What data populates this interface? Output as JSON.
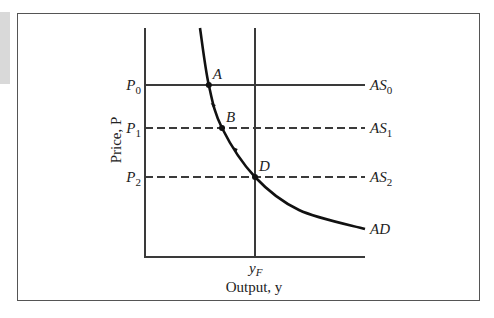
{
  "chart_data": {
    "type": "line",
    "title": "",
    "xlabel": "Output, y",
    "ylabel": "Price, P",
    "grid": false,
    "x_ticks": [
      {
        "label_main": "y",
        "label_sub": "F",
        "value": 0.5
      }
    ],
    "y_ticks": [
      {
        "label_main": "P",
        "label_sub": "0",
        "value": 0.75
      },
      {
        "label_main": "P",
        "label_sub": "1",
        "value": 0.56
      },
      {
        "label_main": "P",
        "label_sub": "2",
        "value": 0.35
      }
    ],
    "xlim": [
      0,
      1
    ],
    "ylim": [
      0,
      1
    ],
    "series": [
      {
        "name": "AS0",
        "label_main": "AS",
        "label_sub": "0",
        "style": "solid",
        "y": 0.75
      },
      {
        "name": "AS1",
        "label_main": "AS",
        "label_sub": "1",
        "style": "dashed",
        "y": 0.56
      },
      {
        "name": "AS2",
        "label_main": "AS",
        "label_sub": "2",
        "style": "dashed",
        "y": 0.35
      },
      {
        "name": "AD",
        "label_main": "AD",
        "style": "solid-curve",
        "points": [
          [
            0.25,
            1.0
          ],
          [
            0.29,
            0.75
          ],
          [
            0.35,
            0.56
          ],
          [
            0.5,
            0.35
          ],
          [
            0.7,
            0.19
          ],
          [
            1.0,
            0.12
          ]
        ]
      },
      {
        "name": "full-employment-output",
        "style": "vertical-line",
        "x": 0.5
      }
    ],
    "annotations": [
      {
        "label": "A",
        "x": 0.29,
        "y": 0.75
      },
      {
        "label": "B",
        "x": 0.35,
        "y": 0.56
      },
      {
        "label": "D",
        "x": 0.5,
        "y": 0.35
      }
    ],
    "arrows_on_curve": [
      [
        0.31,
        0.66
      ],
      [
        0.41,
        0.46
      ]
    ]
  }
}
